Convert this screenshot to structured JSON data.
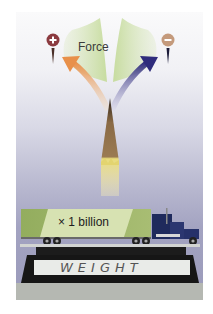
{
  "figure": {
    "force_label": "Force",
    "positive_sign": "+",
    "negative_sign": "−",
    "truck_multiplier_label": "× 1 billion",
    "scale_label": "WEIGHT",
    "icons": {
      "positive": "plus-charge-icon",
      "negative": "minus-charge-icon",
      "pencil": "pencil-tip-icon",
      "truck": "semi-truck-icon",
      "scale": "weighing-scale-icon"
    },
    "colors": {
      "wedge_green": "#d3e4b4",
      "positive_circle": "#8b3a3f",
      "negative_circle": "#c49a7c",
      "arrow_left": "#e79a52",
      "arrow_right": "#3e3b86",
      "trailer_green": "#9fb36a",
      "trailer_label_bg": "#d7e2b2",
      "truck_cab": "#1f2a5c",
      "pencil_wood": "#8a6a45",
      "pencil_body": "#e8d76a"
    }
  }
}
